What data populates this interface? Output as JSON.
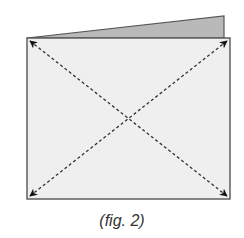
{
  "figure": {
    "caption": "(fig. 2)",
    "colors": {
      "front_panel": "#efefef",
      "back_flap": "#b9b9b9",
      "outline": "#555555",
      "arrows": "#222222"
    }
  }
}
